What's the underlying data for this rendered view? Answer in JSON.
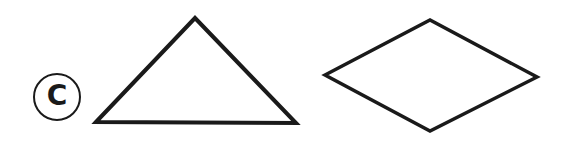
{
  "figure": {
    "label": "C",
    "stroke_color": "#1a1a1a",
    "background": "#ffffff",
    "shapes": [
      {
        "name": "triangle",
        "points": "96,122 195,18 296,123"
      },
      {
        "name": "rhombus",
        "points": "325,75 430,20 537,77 430,131"
      }
    ]
  }
}
